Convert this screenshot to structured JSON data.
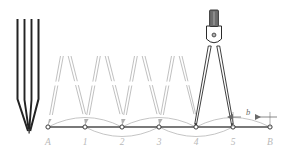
{
  "figure": {
    "type": "technical-drawing",
    "background_color": "#ffffff"
  },
  "colors": {
    "baseline": "#4d4d4d",
    "instrument_stroke": "#2b2b2b",
    "instrument_fill": "#ffffff",
    "knob_fill": "#6e6e6e",
    "ghost_stroke": "#b0b0b0",
    "arc_stroke": "#b6b6b6",
    "label_gray": "#b9b9b9",
    "dim_gray": "#6a6a6a",
    "closed_compass_stroke": "#232323"
  },
  "baseline": {
    "name": "line-segment-AB",
    "y": 127,
    "x_start": 48,
    "x_end": 270,
    "stroke_width": 1.6
  },
  "points": [
    {
      "label": "A",
      "x": 48,
      "marker": "open-circle",
      "kind": "endpoint"
    },
    {
      "label": "1",
      "x": 85,
      "marker": "open-circle",
      "kind": "division"
    },
    {
      "label": "2",
      "x": 122,
      "marker": "open-circle",
      "kind": "division"
    },
    {
      "label": "3",
      "x": 159,
      "marker": "open-circle",
      "kind": "division"
    },
    {
      "label": "4",
      "x": 196,
      "marker": "open-circle",
      "kind": "division"
    },
    {
      "label": "5",
      "x": 233,
      "marker": "open-circle",
      "kind": "division"
    },
    {
      "label": "B",
      "x": 270,
      "marker": "open-circle",
      "kind": "endpoint"
    }
  ],
  "step_span": 37,
  "dimension": {
    "label": "b",
    "name": "remainder-dimension",
    "from_point": "5",
    "to_point": "B",
    "x_start": 233,
    "x_end": 270,
    "y": 117,
    "label_x": 248,
    "label_y": 114
  },
  "arcs": {
    "note": "construction arcs swung above and below the baseline between consecutive division points",
    "above": [
      {
        "from": 48,
        "to": 122,
        "bulge": 14
      },
      {
        "from": 122,
        "to": 196,
        "bulge": 14
      },
      {
        "from": 196,
        "to": 270,
        "bulge": 14
      }
    ],
    "below": [
      {
        "from": 85,
        "to": 159,
        "bulge": 14
      },
      {
        "from": 159,
        "to": 233,
        "bulge": 14
      }
    ]
  },
  "closed_compass": {
    "name": "closed-dividers",
    "description": "dividers shown closed, legs together, points down",
    "x_center": 29,
    "top_y": 18,
    "tip_y": 133
  },
  "ghost_compasses": [
    {
      "name": "ghost-position-1",
      "apex_x": 66,
      "left_foot": 48,
      "right_foot": 85
    },
    {
      "name": "ghost-position-2",
      "apex_x": 103,
      "left_foot": 85,
      "right_foot": 122
    },
    {
      "name": "ghost-position-3",
      "apex_x": 140,
      "left_foot": 122,
      "right_foot": 159
    },
    {
      "name": "ghost-position-4",
      "apex_x": 177,
      "left_foot": 159,
      "right_foot": 196
    }
  ],
  "open_compass": {
    "name": "open-dividers",
    "description": "dividers shown open, spanning from point 4 to point 5",
    "apex_x": 214,
    "apex_y": 43,
    "left_foot_x": 196,
    "right_foot_x": 233,
    "foot_y": 127,
    "head": {
      "knob_label": "adjustment-knob",
      "hinge_label": "pivot-hinge"
    }
  }
}
